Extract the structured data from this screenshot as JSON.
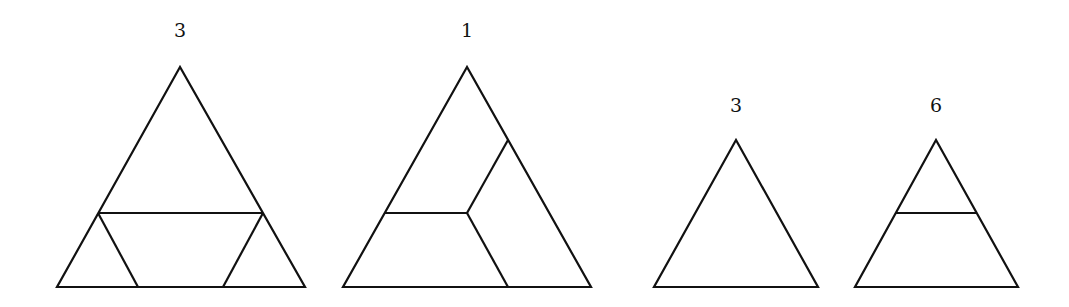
{
  "figures": [
    {
      "label": "3",
      "description": "large triangle cut by a horizontal line into a top triangle and bottom trapezoid; trapezoid split into two corner triangles and a central parallelogram"
    },
    {
      "label": "1",
      "description": "large triangle divided into three quadrilaterals meeting at an interior point"
    },
    {
      "label": "3",
      "description": "small undivided equilateral triangle"
    },
    {
      "label": "6",
      "description": "small triangle with one horizontal line dividing it into a top triangle and bottom trapezoid"
    }
  ]
}
